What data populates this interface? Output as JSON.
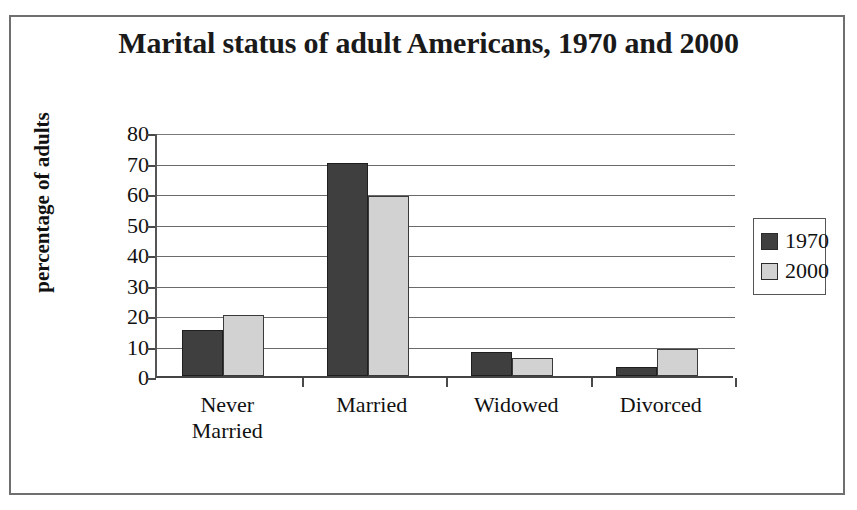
{
  "chart_data": {
    "type": "bar",
    "title": "Marital status of adult Americans, 1970 and 2000",
    "xlabel": "",
    "ylabel": "percentage of adults",
    "categories": [
      "Never Married",
      "Married",
      "Widowed",
      "Divorced"
    ],
    "category_lines": [
      [
        "Never",
        "Married"
      ],
      [
        "Married"
      ],
      [
        "Widowed"
      ],
      [
        "Divorced"
      ]
    ],
    "series": [
      {
        "name": "1970",
        "color": "#3f3f3f",
        "values": [
          15,
          70,
          8,
          3
        ]
      },
      {
        "name": "2000",
        "color": "#d2d2d2",
        "values": [
          20,
          59,
          6,
          9
        ]
      }
    ],
    "ylim": [
      0,
      80
    ],
    "ytick_labels": [
      "80",
      "70",
      "60",
      "50",
      "40",
      "30",
      "20",
      "10",
      "0"
    ],
    "ytick_values": [
      80,
      70,
      60,
      50,
      40,
      30,
      20,
      10,
      0
    ],
    "grid": true,
    "legend_position": "right",
    "legend_entries": [
      "1970",
      "2000"
    ]
  }
}
